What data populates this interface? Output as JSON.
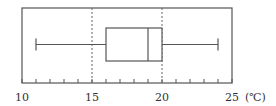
{
  "chart_data": {
    "type": "boxplot",
    "title": "",
    "xlabel": "(℃)",
    "ylabel": "",
    "xlim": [
      10,
      25
    ],
    "x_ticks_major": [
      10,
      15,
      20,
      25
    ],
    "x_ticks_minor_step": 1,
    "reference_lines": [
      15,
      20
    ],
    "series": [
      {
        "name": "temperature",
        "min": 11,
        "q1": 16,
        "median": 19,
        "q3": 20,
        "max": 24
      }
    ],
    "grid": false,
    "legend": null
  },
  "axis": {
    "tick_labels": [
      "10",
      "15",
      "20",
      "25"
    ],
    "unit": "(℃)"
  },
  "colors": {
    "line": "#555555",
    "dashed": "#666666",
    "text": "#333333"
  }
}
